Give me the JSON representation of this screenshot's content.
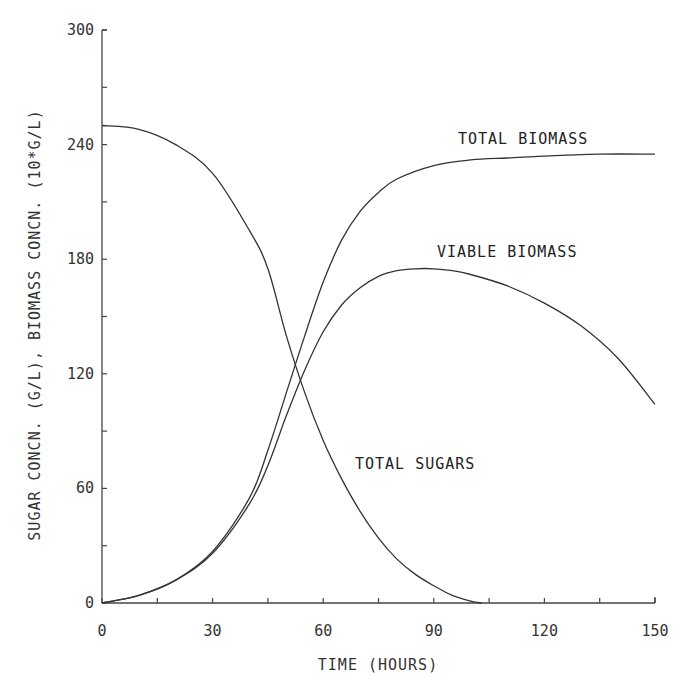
{
  "chart_data": {
    "type": "line",
    "title": "",
    "xlabel": "TIME (HOURS)",
    "ylabel": "SUGAR CONCN. (G/L), BIOMASS CONCN. (10*G/L)",
    "xlim": [
      0,
      150
    ],
    "ylim": [
      0,
      300
    ],
    "x_ticks": [
      0,
      30,
      60,
      90,
      120,
      150
    ],
    "y_ticks": [
      0,
      60,
      120,
      180,
      240,
      300
    ],
    "x_minor_step": 15,
    "y_minor_step": 30,
    "grid": false,
    "legend": "inline labels",
    "series": [
      {
        "name": "TOTAL SUGARS",
        "x": [
          0,
          10,
          20,
          30,
          40,
          45,
          50,
          55,
          60,
          65,
          70,
          75,
          80,
          85,
          90,
          95,
          100,
          103
        ],
        "values": [
          250,
          248,
          240,
          225,
          195,
          175,
          140,
          110,
          85,
          65,
          48,
          34,
          23,
          15,
          9,
          4,
          1,
          0
        ],
        "label_pos": {
          "x": 355,
          "y": 469
        }
      },
      {
        "name": "TOTAL BIOMASS",
        "x": [
          0,
          10,
          20,
          30,
          40,
          45,
          50,
          55,
          60,
          65,
          70,
          75,
          80,
          90,
          100,
          110,
          120,
          135,
          150
        ],
        "values": [
          0,
          4,
          12,
          27,
          55,
          80,
          110,
          140,
          168,
          190,
          205,
          215,
          222,
          229,
          232,
          233,
          234,
          235,
          235
        ],
        "label_pos": {
          "x": 458,
          "y": 144
        }
      },
      {
        "name": "VIABLE BIOMASS",
        "x": [
          0,
          10,
          20,
          30,
          40,
          45,
          50,
          55,
          60,
          65,
          70,
          75,
          80,
          85,
          90,
          95,
          100,
          110,
          120,
          130,
          140,
          150
        ],
        "values": [
          0,
          4,
          12,
          26,
          52,
          72,
          98,
          122,
          142,
          156,
          165,
          171,
          174,
          175,
          175,
          174,
          172,
          166,
          157,
          145,
          128,
          104
        ],
        "label_pos": {
          "x": 437,
          "y": 257
        }
      }
    ]
  },
  "axes": {
    "x_tick_labels": [
      "0",
      "30",
      "60",
      "90",
      "120",
      "150"
    ],
    "y_tick_labels": [
      "0",
      "60",
      "120",
      "180",
      "240",
      "300"
    ],
    "x_title": "TIME (HOURS)",
    "y_title": "SUGAR CONCN. (G/L), BIOMASS CONCN. (10*G/L)"
  },
  "colors": {
    "line": "#333333",
    "axis": "#444444",
    "background": "#ffffff"
  }
}
